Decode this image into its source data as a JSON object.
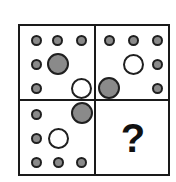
{
  "puzzle": {
    "type": "matrix-reasoning",
    "title": "2x2 dot pattern matrix with missing element",
    "grid": {
      "rows": 2,
      "columns": 2
    },
    "colors": {
      "stroke": "#1f1f1f",
      "gray_fill": "#8a8a8a",
      "white_fill": "#ffffff",
      "background": "#ffffff",
      "frame": "#1a1a1a"
    },
    "cells": [
      {
        "id": "cell-top-left",
        "position": "top-left",
        "is_answer_slot": false,
        "shapes": [
          {
            "kind": "small-gray-dot",
            "x": 16,
            "y": 14
          },
          {
            "kind": "small-gray-dot",
            "x": 37,
            "y": 14
          },
          {
            "kind": "small-gray-dot",
            "x": 61,
            "y": 14
          },
          {
            "kind": "small-gray-dot",
            "x": 16,
            "y": 38
          },
          {
            "kind": "large-gray-circle",
            "x": 38,
            "y": 38
          },
          {
            "kind": "small-gray-dot",
            "x": 16,
            "y": 62
          },
          {
            "kind": "large-white-circle",
            "x": 61,
            "y": 62
          }
        ]
      },
      {
        "id": "cell-top-right",
        "position": "top-right",
        "is_answer_slot": false,
        "shapes": [
          {
            "kind": "small-gray-dot",
            "x": 13,
            "y": 14
          },
          {
            "kind": "small-gray-dot",
            "x": 37,
            "y": 14
          },
          {
            "kind": "small-gray-dot",
            "x": 61,
            "y": 14
          },
          {
            "kind": "large-white-circle",
            "x": 37,
            "y": 38
          },
          {
            "kind": "small-gray-dot",
            "x": 61,
            "y": 38
          },
          {
            "kind": "large-gray-circle",
            "x": 13,
            "y": 62
          },
          {
            "kind": "small-gray-dot",
            "x": 61,
            "y": 62
          }
        ]
      },
      {
        "id": "cell-bottom-left",
        "position": "bottom-left",
        "is_answer_slot": false,
        "shapes": [
          {
            "kind": "small-gray-dot",
            "x": 16,
            "y": 13
          },
          {
            "kind": "large-gray-circle",
            "x": 62,
            "y": 12
          },
          {
            "kind": "small-gray-dot",
            "x": 16,
            "y": 37
          },
          {
            "kind": "large-white-circle",
            "x": 38,
            "y": 37
          },
          {
            "kind": "small-gray-dot",
            "x": 16,
            "y": 61
          },
          {
            "kind": "small-gray-dot",
            "x": 38,
            "y": 61
          },
          {
            "kind": "small-gray-dot",
            "x": 61,
            "y": 61
          }
        ]
      },
      {
        "id": "cell-bottom-right",
        "position": "bottom-right",
        "is_answer_slot": true,
        "answer_symbol": "?",
        "shapes": []
      }
    ]
  }
}
